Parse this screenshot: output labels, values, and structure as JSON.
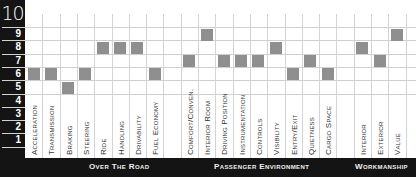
{
  "chart_data": {
    "type": "heatmap",
    "title": "",
    "ylabel": "",
    "ylim": [
      1,
      10
    ],
    "y_ticks": [
      "10",
      "9",
      "8",
      "7",
      "6",
      "5",
      "4",
      "3",
      "2",
      "1"
    ],
    "grid": true,
    "categories": [
      "Acceleration",
      "Transmission",
      "Braking",
      "Steering",
      "Ride",
      "Handling",
      "Drivability",
      "Fuel Economy",
      "Comfort/Conven.",
      "Interior Room",
      "Driving Position",
      "Instrumentation",
      "Controls",
      "Visibility",
      "Entry/Exit",
      "Quietness",
      "Cargo Space",
      "Interior",
      "Exterior",
      "Value"
    ],
    "values": [
      6,
      6,
      5,
      6,
      8,
      8,
      8,
      6,
      7,
      9,
      7,
      7,
      7,
      8,
      6,
      7,
      6,
      8,
      7,
      9
    ],
    "groups": [
      {
        "name": "Over The Road",
        "categories": [
          "Acceleration",
          "Transmission",
          "Braking",
          "Steering",
          "Ride",
          "Handling",
          "Drivability",
          "Fuel Economy"
        ]
      },
      {
        "name": "Passenger Environment",
        "categories": [
          "Comfort/Conven.",
          "Interior Room",
          "Driving Position",
          "Instrumentation",
          "Controls",
          "Visibility",
          "Entry/Exit",
          "Quietness",
          "Cargo Space"
        ]
      },
      {
        "name": "Workmanship",
        "categories": [
          "Interior",
          "Exterior",
          "Value"
        ]
      }
    ],
    "colors": {
      "bar": "#8f8f8f",
      "axis_bg": "#141414",
      "grid": "#d0d0d0"
    }
  },
  "axis": {
    "top": "10",
    "rows": [
      "9",
      "8",
      "7",
      "6",
      "5",
      "4",
      "3",
      "2",
      "1"
    ]
  },
  "columns": [
    {
      "label": "Acceleration",
      "value": 6
    },
    {
      "label": "Transmission",
      "value": 6
    },
    {
      "label": "Braking",
      "value": 5
    },
    {
      "label": "Steering",
      "value": 6
    },
    {
      "label": "Ride",
      "value": 8
    },
    {
      "label": "Handling",
      "value": 8
    },
    {
      "label": "Drivability",
      "value": 8
    },
    {
      "label": "Fuel Economy",
      "value": 6
    },
    {
      "label": "Comfort/Conven.",
      "value": 7
    },
    {
      "label": "Interior Room",
      "value": 9
    },
    {
      "label": "Driving Position",
      "value": 7
    },
    {
      "label": "Instrumentation",
      "value": 7
    },
    {
      "label": "Controls",
      "value": 7
    },
    {
      "label": "Visibility",
      "value": 8
    },
    {
      "label": "Entry/Exit",
      "value": 6
    },
    {
      "label": "Quietness",
      "value": 7
    },
    {
      "label": "Cargo Space",
      "value": 6
    },
    {
      "label": "Interior",
      "value": 8
    },
    {
      "label": "Exterior",
      "value": 7
    },
    {
      "label": "Value",
      "value": 9
    }
  ],
  "sections": [
    "Over The Road",
    "Passenger Environment",
    "Workmanship"
  ]
}
